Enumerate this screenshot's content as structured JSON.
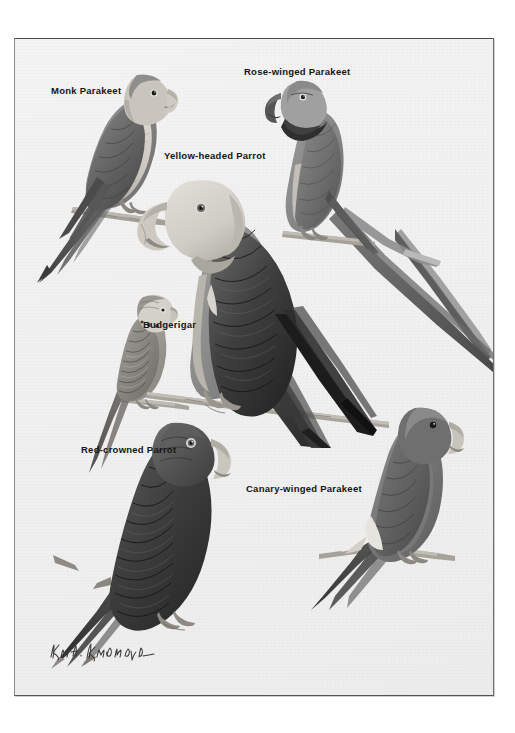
{
  "plate": {
    "background_color": "#f1f1f1",
    "page_background_color": "#ffffff",
    "border_color": "#5a5a5a",
    "media": "printed color-plate illustration of parrots, monochrome / desaturated gray reproduction"
  },
  "labels": [
    {
      "id": "monk-parakeet",
      "text": "Monk Parakeet",
      "x": 50,
      "y": 84
    },
    {
      "id": "rose-winged-parakeet",
      "text": "Rose-winged Parakeet",
      "x": 243,
      "y": 65
    },
    {
      "id": "yellow-headed-parrot",
      "text": "Yellow-headed Parrot",
      "x": 163,
      "y": 149
    },
    {
      "id": "budgerigar",
      "text": "Budgerigar",
      "x": 142,
      "y": 318
    },
    {
      "id": "red-crowned-parrot",
      "text": "Red-crowned Parrot",
      "x": 80,
      "y": 443
    },
    {
      "id": "canary-winged-parakeet",
      "text": "Canary-winged Parakeet",
      "x": 245,
      "y": 482
    }
  ],
  "birds": [
    {
      "id": "monk-parakeet",
      "common_name": "Monk Parakeet",
      "pose": "perched on branch, facing right, long pointed tail down-left",
      "head_tone": "pale gray",
      "body_tone": "medium gray",
      "wing_tone": "dark gray"
    },
    {
      "id": "rose-winged-parakeet",
      "common_name": "Rose-winged Parakeet",
      "pose": "perched on branch, facing left, very long tail sweeping to lower right",
      "head_tone": "medium gray with dark neck ring",
      "body_tone": "medium gray",
      "wing_tone": "gray"
    },
    {
      "id": "yellow-headed-parrot",
      "common_name": "Yellow-headed Parrot",
      "pose": "large central figure perched on branch, facing left, short squared tail",
      "head_tone": "very pale gray",
      "body_tone": "dark gray",
      "wing_tone": "near black"
    },
    {
      "id": "budgerigar",
      "common_name": "Budgerigar",
      "pose": "small bird perched on branch, facing right, barred wings, long tapered tail",
      "head_tone": "pale gray with cheek spots",
      "body_tone": "light gray",
      "wing_tone": "barred gray"
    },
    {
      "id": "red-crowned-parrot",
      "common_name": "Red-crowned Parrot",
      "pose": "perched facing right, stout body, dark scalloped plumage",
      "head_tone": "dark gray",
      "body_tone": "dark gray",
      "wing_tone": "near black"
    },
    {
      "id": "canary-winged-parakeet",
      "common_name": "Canary-winged Parakeet",
      "pose": "perched on branch facing right, white wing patch, long pointed tail to lower left",
      "head_tone": "medium gray",
      "body_tone": "medium gray",
      "wing_tone": "gray with pale wing bar"
    }
  ],
  "signature": {
    "text": "Karl E. Karalus",
    "style": "handwritten cursive artist signature, lower-left of plate"
  }
}
